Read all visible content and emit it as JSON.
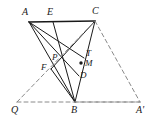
{
  "figure": {
    "width": 156,
    "height": 135,
    "background": "#ffffff",
    "stroke_solid": "#1a1a1a",
    "stroke_dashed": "#8a8a8a",
    "label_color": "#1a1a1a"
  },
  "points": [
    {
      "id": "A",
      "label": "A",
      "x": 29,
      "y": 22,
      "label_x": 22,
      "label_y": 7,
      "size": "normal"
    },
    {
      "id": "E",
      "label": "E",
      "x": 53,
      "y": 22,
      "label_x": 47,
      "label_y": 7,
      "size": "normal"
    },
    {
      "id": "C",
      "label": "C",
      "x": 95,
      "y": 21,
      "label_x": 92,
      "label_y": 6,
      "size": "normal"
    },
    {
      "id": "P",
      "label": "P",
      "x": 58,
      "y": 62,
      "label_x": 52,
      "label_y": 53,
      "size": "small"
    },
    {
      "id": "T",
      "label": "T",
      "x": 84,
      "y": 58,
      "label_x": 86,
      "label_y": 49,
      "size": "small"
    },
    {
      "id": "M",
      "label": "M",
      "x": 81,
      "y": 63,
      "label_x": 85,
      "label_y": 59,
      "size": "small"
    },
    {
      "id": "F",
      "label": "F",
      "x": 51,
      "y": 69,
      "label_x": 41,
      "label_y": 63,
      "size": "small"
    },
    {
      "id": "D",
      "label": "D",
      "x": 79,
      "y": 76,
      "label_x": 80,
      "label_y": 71,
      "size": "small"
    },
    {
      "id": "Q",
      "label": "Q",
      "x": 17,
      "y": 102,
      "label_x": 11,
      "label_y": 105,
      "size": "normal"
    },
    {
      "id": "B",
      "label": "B",
      "x": 75,
      "y": 102,
      "label_x": 71,
      "label_y": 105,
      "size": "normal"
    },
    {
      "id": "A2",
      "label": "A'",
      "x": 140,
      "y": 102,
      "label_x": 136,
      "label_y": 105,
      "size": "normal"
    }
  ],
  "segments": [
    {
      "name": "segment-A-C",
      "from": "A",
      "to": "C",
      "style": "solid",
      "width": 1.6
    },
    {
      "name": "segment-A-B",
      "from": "A",
      "to": "B",
      "style": "solid",
      "width": 1.0
    },
    {
      "name": "segment-A-D",
      "from": "A",
      "to": "D",
      "style": "solid",
      "width": 1.0
    },
    {
      "name": "segment-A-T",
      "from": "A",
      "to": "T",
      "style": "solid",
      "width": 1.0
    },
    {
      "name": "segment-C-B",
      "from": "C",
      "to": "B",
      "style": "solid",
      "width": 1.0
    },
    {
      "name": "segment-C-F",
      "from": "C",
      "to": "F",
      "style": "solid",
      "width": 1.0
    },
    {
      "name": "segment-E-B",
      "from": "E",
      "to": "B",
      "style": "solid",
      "width": 1.0
    },
    {
      "name": "segment-F-B",
      "from": "F",
      "to": "B",
      "style": "solid",
      "width": 1.0
    },
    {
      "name": "segment-C-A-prime",
      "from": "C",
      "to": "A2",
      "style": "dashed",
      "width": 1.0
    },
    {
      "name": "segment-Q-A-prime",
      "from": "Q",
      "to": "A2",
      "style": "dashed",
      "width": 1.0
    },
    {
      "name": "segment-Q-C",
      "from": "Q",
      "to": "C",
      "style": "dashed",
      "width": 1.0
    },
    {
      "name": "segment-B-A-prime-diag",
      "from": "B",
      "to": "A2",
      "style": "dashed",
      "width": 1.0
    }
  ],
  "marked_points": [
    {
      "name": "point-marker-M",
      "at": "M",
      "radius": 1.7
    }
  ]
}
